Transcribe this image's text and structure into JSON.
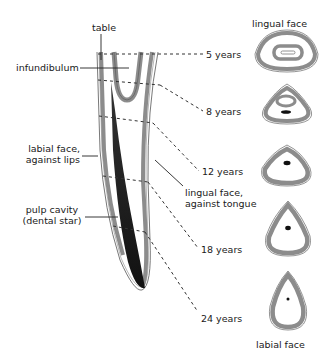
{
  "diagram": {
    "type": "anatomical-diagram",
    "colors": {
      "ink": "#1a1a1a",
      "enamel_gray": "#8c8c8c",
      "pulp_dark": "#222222",
      "background": "#ffffff"
    },
    "labels": {
      "table": "table",
      "infundibulum": "infundibulum",
      "labial_face_line1": "labial face,",
      "labial_face_line2": "against lips",
      "pulp_line1": "pulp cavity",
      "pulp_line2": "(dental star)",
      "lingual_face_side_line1": "lingual face,",
      "lingual_face_side_line2": "against tongue",
      "lingual_face_top": "lingual face",
      "labial_face_bottom": "labial face"
    },
    "ages": [
      {
        "label": "5 years",
        "section": "oval with large infundibulum ring"
      },
      {
        "label": "8 years",
        "section": "rounded triangle with infundibulum and dental star"
      },
      {
        "label": "12 years",
        "section": "triangle with dental star"
      },
      {
        "label": "18 years",
        "section": "taller triangle with dental star"
      },
      {
        "label": "24 years",
        "section": "elongated triangle with small dot"
      }
    ]
  }
}
